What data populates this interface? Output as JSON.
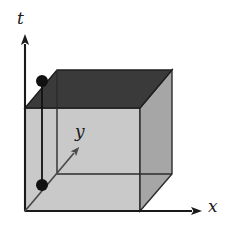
{
  "figure": {
    "type": "3d-cube-spacetime-diagram",
    "background_color": "#ffffff",
    "axes": [
      {
        "id": "t",
        "label": "t",
        "orientation": "vertical",
        "direction": "up",
        "line": {
          "x1": 25,
          "y1": 211,
          "x2": 25,
          "y2": 44
        },
        "arrow_tip": {
          "x": 25,
          "y": 36
        },
        "label_position": {
          "x": 17,
          "y": 10
        },
        "color": "#1a1a1a"
      },
      {
        "id": "x",
        "label": "x",
        "orientation": "horizontal",
        "direction": "right",
        "line": {
          "x1": 25,
          "y1": 211,
          "x2": 192,
          "y2": 211
        },
        "arrow_tip": {
          "x": 202,
          "y": 211
        },
        "label_position": {
          "x": 208,
          "y": 198
        },
        "color": "#1a1a1a"
      },
      {
        "id": "y",
        "label": "y",
        "orientation": "diagonal",
        "direction": "up-right",
        "line": {
          "x1": 25,
          "y1": 211,
          "x2": 74,
          "y2": 153
        },
        "arrow_tip": {
          "x": 80,
          "y": 146
        },
        "label_position": {
          "x": 75,
          "y": 123
        },
        "color": "#4a4a4a"
      }
    ],
    "cube": {
      "name": "spacetime-volume-cube",
      "faces": {
        "front": {
          "fill": "#c9c9c9",
          "stroke": "#2b2b2b",
          "points": "25,108 140,108 140,211 25,211"
        },
        "right": {
          "fill": "#a6a6a6",
          "stroke": "#2b2b2b",
          "points": "140,108 172,70 172,174 140,211"
        },
        "top": {
          "fill": "#3a3a3a",
          "stroke": "#1e1e1e",
          "points": "25,108 57,70 172,70 140,108"
        }
      },
      "hidden_back_edges": [
        {
          "name": "back-vertical-left",
          "x1": 57,
          "y1": 70,
          "x2": 57,
          "y2": 174
        },
        {
          "name": "back-bottom-horizontal",
          "x1": 57,
          "y1": 174,
          "x2": 172,
          "y2": 174
        }
      ],
      "corners": {
        "front_top_left": {
          "x": 25,
          "y": 108
        },
        "front_top_right": {
          "x": 140,
          "y": 108
        },
        "front_bottom_left": {
          "x": 25,
          "y": 211
        },
        "front_bottom_right": {
          "x": 140,
          "y": 211
        },
        "back_top_left": {
          "x": 57,
          "y": 70
        },
        "back_top_right": {
          "x": 172,
          "y": 70
        },
        "back_bottom_left": {
          "x": 57,
          "y": 174
        },
        "back_bottom_right": {
          "x": 172,
          "y": 174
        }
      }
    },
    "worldline": {
      "name": "vertical-worldline-segment",
      "stroke": "#111111",
      "x1": 42,
      "y1": 81,
      "x2": 42,
      "y2": 185
    },
    "points": [
      {
        "name": "upper-event-point",
        "cx": 42,
        "cy": 81,
        "r": 6,
        "fill": "#111111"
      },
      {
        "name": "lower-event-point",
        "cx": 42,
        "cy": 185,
        "r": 6,
        "fill": "#111111"
      }
    ]
  },
  "chart_data": {
    "type": "diagram",
    "title": "",
    "xlabel": "x",
    "ylabel": "t",
    "zlabel": "y",
    "axis_labels": [
      "t",
      "y",
      "x"
    ],
    "marked_points": [
      {
        "label": "",
        "screen_x": 42,
        "screen_y": 81
      },
      {
        "label": "",
        "screen_x": 42,
        "screen_y": 185
      }
    ],
    "grid": false,
    "legend": false
  }
}
